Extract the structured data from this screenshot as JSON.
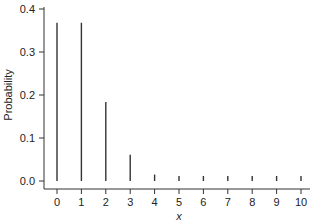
{
  "chart_data": {
    "type": "bar",
    "style": "spike",
    "title": "",
    "xlabel": "x",
    "ylabel": "Probability",
    "categories": [
      "0",
      "1",
      "2",
      "3",
      "4",
      "5",
      "6",
      "7",
      "8",
      "9",
      "10"
    ],
    "values": [
      0.368,
      0.368,
      0.184,
      0.061,
      0.015,
      0.003,
      0.0005,
      0.0001,
      0.0,
      0.0,
      0.0
    ],
    "ylim": [
      0,
      0.4
    ],
    "yticks": [
      "0.0",
      "0.1",
      "0.2",
      "0.3",
      "0.4"
    ],
    "grid": false,
    "legend": null
  }
}
